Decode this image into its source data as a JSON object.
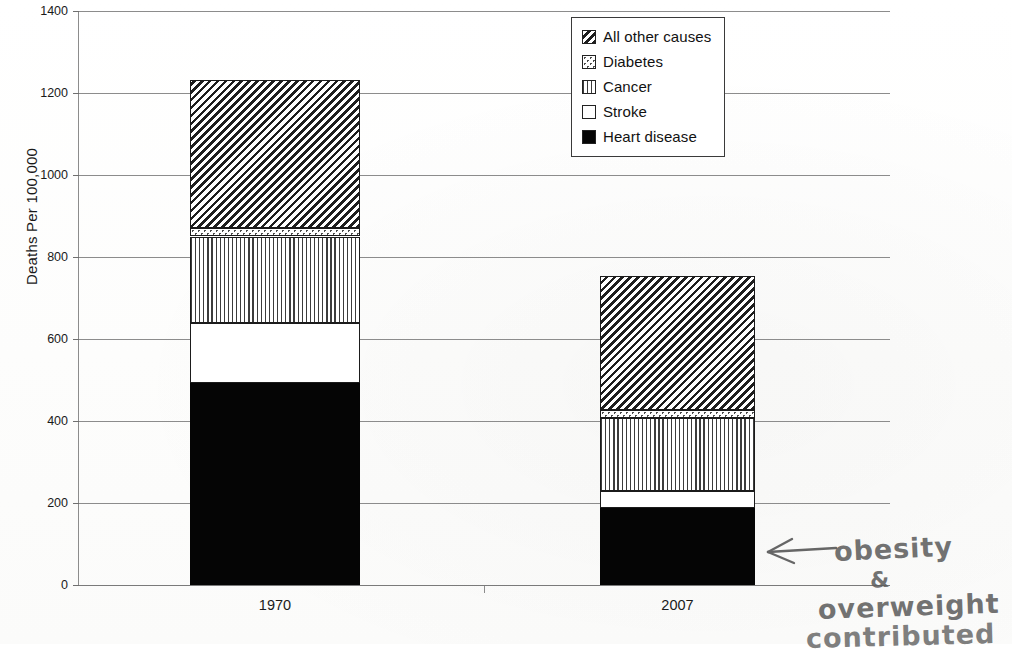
{
  "chart_data": {
    "type": "bar",
    "subtype": "stacked-bar",
    "title": "",
    "xlabel": "",
    "ylabel": "Deaths Per 100,000",
    "categories": [
      "1970",
      "2007"
    ],
    "ylim": [
      0,
      1400
    ],
    "yticks": [
      0,
      200,
      400,
      600,
      800,
      1000,
      1200,
      1400
    ],
    "ytick_labels": [
      "0",
      "200",
      "400",
      "600",
      "800",
      "1000",
      "1200",
      "1400"
    ],
    "grid": true,
    "legend_position": "top-right",
    "stack_order_bottom_to_top": [
      "Heart disease",
      "Stroke",
      "Cancer",
      "Diabetes",
      "All other causes"
    ],
    "series": [
      {
        "name": "Heart disease",
        "pattern": "solid-black",
        "values": [
          492,
          188
        ]
      },
      {
        "name": "Stroke",
        "pattern": "white",
        "values": [
          148,
          41
        ]
      },
      {
        "name": "Cancer",
        "pattern": "vertical-lines",
        "values": [
          210,
          178
        ]
      },
      {
        "name": "Diabetes",
        "pattern": "dotted",
        "values": [
          20,
          19
        ]
      },
      {
        "name": "All other causes",
        "pattern": "diagonal-hatch",
        "values": [
          362,
          328
        ]
      }
    ],
    "totals": [
      1232,
      754
    ]
  },
  "legend": {
    "items": [
      {
        "label": "All other causes",
        "pattern": "diagonal-hatch"
      },
      {
        "label": "Diabetes",
        "pattern": "dotted"
      },
      {
        "label": "Cancer",
        "pattern": "vertical-lines"
      },
      {
        "label": "Stroke",
        "pattern": "white"
      },
      {
        "label": "Heart disease",
        "pattern": "solid-black"
      }
    ]
  },
  "annotation": {
    "arrow": "left-arrow",
    "line1": "obesity",
    "line2": "&",
    "line3": "overweight",
    "line4": "contributed"
  }
}
